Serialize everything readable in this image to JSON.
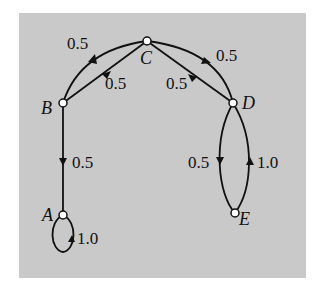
{
  "diagram": {
    "type": "markov-chain-state-graph",
    "background_color": "#c9c9c9",
    "nodes": [
      {
        "id": "A",
        "label": "A"
      },
      {
        "id": "B",
        "label": "B"
      },
      {
        "id": "C",
        "label": "C"
      },
      {
        "id": "D",
        "label": "D"
      },
      {
        "id": "E",
        "label": "E"
      }
    ],
    "edges": [
      {
        "from": "B",
        "to": "C",
        "label": "0.5",
        "shape": "outer-arc"
      },
      {
        "from": "C",
        "to": "B",
        "label": "0.5",
        "shape": "straight"
      },
      {
        "from": "C",
        "to": "D",
        "label": "0.5",
        "shape": "straight"
      },
      {
        "from": "D",
        "to": "C",
        "label": "0.5",
        "shape": "outer-arc"
      },
      {
        "from": "B",
        "to": "A",
        "label": "0.5",
        "shape": "straight"
      },
      {
        "from": "A",
        "to": "A",
        "label": "1.0",
        "shape": "self-loop"
      },
      {
        "from": "D",
        "to": "E",
        "label": "0.5",
        "shape": "left-arc"
      },
      {
        "from": "E",
        "to": "D",
        "label": "1.0",
        "shape": "right-arc"
      }
    ]
  }
}
